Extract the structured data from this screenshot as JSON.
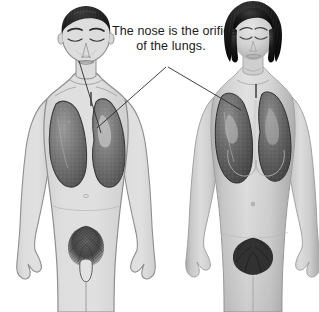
{
  "figure": {
    "background_color": "#ffffff",
    "width": 320,
    "height": 312,
    "border_color": "#d8d8d8"
  },
  "annotation": {
    "name": "nose-lungs-caption",
    "text_line_1": "The nose is the orifice",
    "text_line_2": "of the lungs.",
    "full_text": "The nose is the orifice of the lungs.",
    "text_color": "#1a1a1a",
    "font_size_px": 12.5
  },
  "leader_lines": [
    {
      "name": "leader-line-to-male-lung",
      "from": "caption apex",
      "to": "male right lung",
      "x1": 166,
      "y1": 67,
      "x2": 97,
      "y2": 128,
      "color": "#2b2b2b"
    },
    {
      "name": "leader-line-to-female-lung",
      "from": "caption apex",
      "to": "female right lung",
      "x1": 168,
      "y1": 67,
      "x2": 241,
      "y2": 110,
      "color": "#2b2b2b"
    },
    {
      "name": "leader-line-male-nose-to-lung",
      "from": "male nose",
      "to": "male left lung",
      "x1": 79,
      "y1": 61,
      "x2": 101,
      "y2": 133,
      "color": "#2b2b2b"
    }
  ],
  "figures": [
    {
      "name": "male-figure",
      "style": "line-drawing",
      "sex": "male",
      "pose": "standing frontal, eyes closed",
      "skin_fill": "#dddddd",
      "outline_color": "#8c8c8c",
      "hair_color": "#1c1c1c",
      "lung_fill": "#6e6e6e",
      "lung_outline": "#3a3a3a",
      "visible_organs": [
        "left lung",
        "right lung"
      ],
      "cropped_at": "mid-thigh",
      "parts": [
        "head",
        "neck",
        "shoulders",
        "torso",
        "arms",
        "hands",
        "pubic hair",
        "genitals",
        "thighs"
      ]
    },
    {
      "name": "female-figure",
      "style": "photo-realistic grayscale",
      "sex": "female",
      "pose": "standing frontal, eyes closed",
      "skin_fill": "#c9c9c9",
      "outline_color": "#9a9a9a",
      "hair_color": "#101010",
      "hair_style": "short bob",
      "lung_fill": "#5d5d5d",
      "lung_outline": "#2e2e2e",
      "visible_organs": [
        "left lung",
        "right lung"
      ],
      "cropped_at": "mid-thigh",
      "parts": [
        "head",
        "neck",
        "shoulders",
        "torso",
        "breasts",
        "navel",
        "arms",
        "hands",
        "pubic hair",
        "thighs"
      ]
    }
  ]
}
